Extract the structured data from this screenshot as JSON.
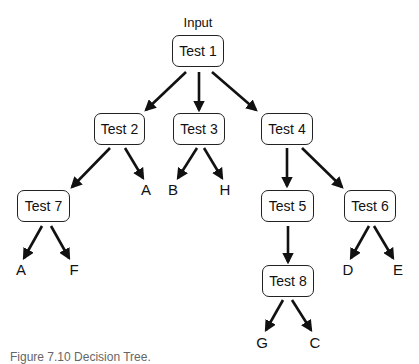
{
  "diagram": {
    "input_label": "Input",
    "nodes": {
      "t1": {
        "label": "Test 1",
        "x": 172,
        "y": 35,
        "w": 52,
        "h": 32
      },
      "t2": {
        "label": "Test 2",
        "x": 94,
        "y": 113,
        "w": 51,
        "h": 32
      },
      "t3": {
        "label": "Test 3",
        "x": 173,
        "y": 113,
        "w": 52,
        "h": 32
      },
      "t4": {
        "label": "Test 4",
        "x": 261,
        "y": 113,
        "w": 52,
        "h": 32
      },
      "t7": {
        "label": "Test 7",
        "x": 17,
        "y": 190,
        "w": 53,
        "h": 32
      },
      "t5": {
        "label": "Test 5",
        "x": 261,
        "y": 190,
        "w": 53,
        "h": 32
      },
      "t6": {
        "label": "Test 6",
        "x": 344,
        "y": 190,
        "w": 52,
        "h": 32
      },
      "t8": {
        "label": "Test 8",
        "x": 262,
        "y": 265,
        "w": 52,
        "h": 32
      }
    },
    "leaves": {
      "t2_a": {
        "label": "A",
        "x": 146,
        "y": 189
      },
      "t3_b": {
        "label": "B",
        "x": 173,
        "y": 189
      },
      "t3_h": {
        "label": "H",
        "x": 225,
        "y": 189
      },
      "t7_a": {
        "label": "A",
        "x": 21,
        "y": 269
      },
      "t7_f": {
        "label": "F",
        "x": 74,
        "y": 269
      },
      "t6_d": {
        "label": "D",
        "x": 348,
        "y": 269
      },
      "t6_e": {
        "label": "E",
        "x": 398,
        "y": 269
      },
      "t8_g": {
        "label": "G",
        "x": 262,
        "y": 342
      },
      "t8_c": {
        "label": "C",
        "x": 315,
        "y": 342
      }
    },
    "edges": [
      {
        "from": "t1",
        "to": "t2",
        "x1": 186,
        "y1": 72,
        "x2": 146,
        "y2": 110
      },
      {
        "from": "t1",
        "to": "t3",
        "x1": 199,
        "y1": 72,
        "x2": 199,
        "y2": 110
      },
      {
        "from": "t1",
        "to": "t4",
        "x1": 212,
        "y1": 72,
        "x2": 256,
        "y2": 110
      },
      {
        "from": "t2",
        "to": "t7",
        "x1": 110,
        "y1": 148,
        "x2": 72,
        "y2": 187
      },
      {
        "from": "t2",
        "to": "t2_a",
        "x1": 125,
        "y1": 148,
        "x2": 143,
        "y2": 178
      },
      {
        "from": "t3",
        "to": "t3_b",
        "x1": 197,
        "y1": 148,
        "x2": 178,
        "y2": 178
      },
      {
        "from": "t3",
        "to": "t3_h",
        "x1": 204,
        "y1": 148,
        "x2": 222,
        "y2": 178
      },
      {
        "from": "t4",
        "to": "t5",
        "x1": 287,
        "y1": 148,
        "x2": 287,
        "y2": 186
      },
      {
        "from": "t4",
        "to": "t6",
        "x1": 302,
        "y1": 148,
        "x2": 342,
        "y2": 187
      },
      {
        "from": "t7",
        "to": "t7_a",
        "x1": 42,
        "y1": 226,
        "x2": 24,
        "y2": 258
      },
      {
        "from": "t7",
        "to": "t7_f",
        "x1": 51,
        "y1": 226,
        "x2": 69,
        "y2": 258
      },
      {
        "from": "t5",
        "to": "t8",
        "x1": 288,
        "y1": 226,
        "x2": 288,
        "y2": 262
      },
      {
        "from": "t6",
        "to": "t6_d",
        "x1": 369,
        "y1": 226,
        "x2": 351,
        "y2": 258
      },
      {
        "from": "t6",
        "to": "t6_e",
        "x1": 374,
        "y1": 226,
        "x2": 393,
        "y2": 258
      },
      {
        "from": "t8",
        "to": "t8_g",
        "x1": 283,
        "y1": 300,
        "x2": 266,
        "y2": 330
      },
      {
        "from": "t8",
        "to": "t8_c",
        "x1": 292,
        "y1": 300,
        "x2": 311,
        "y2": 330
      }
    ]
  },
  "caption": "Figure 7.10  Decision Tree."
}
